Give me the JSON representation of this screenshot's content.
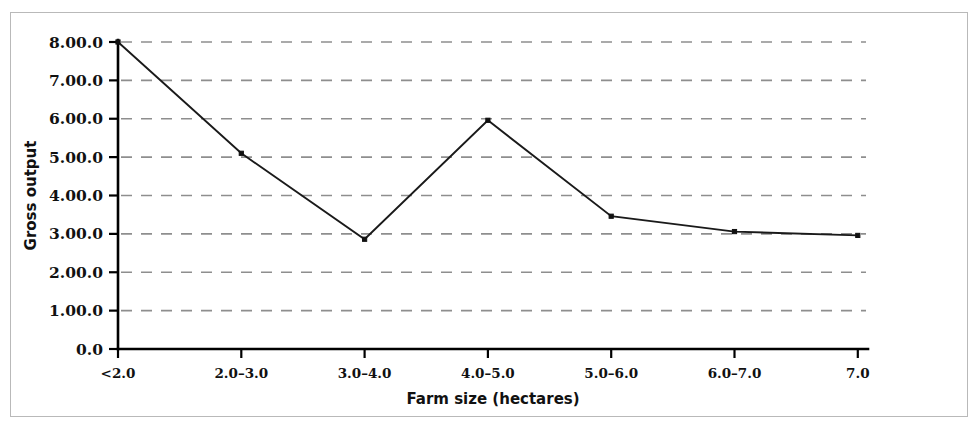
{
  "figure": {
    "background_color": "#ffffff",
    "frame_color": "#b9b9b9",
    "line_color": "#1a1a1a",
    "grid_color": "#8e8e8e",
    "axis_color": "#000000"
  },
  "axes": {
    "y_title": "Gross output",
    "x_title": "Farm size (hectares)"
  },
  "chart_data": {
    "type": "line",
    "title": "",
    "subtitle": "",
    "xlabel": "Farm size (hectares)",
    "ylabel": "Gross output",
    "categories": [
      "<2.0",
      "2.0–3.0",
      "3.0–4.0",
      "4.0–5.0",
      "5.0–6.0",
      "6.0–7.0",
      "7.0"
    ],
    "values": [
      8000.0,
      5100.0,
      2860.0,
      5960.0,
      3460.0,
      3060.0,
      2960.0
    ],
    "y_tick_values": [
      0,
      1000,
      2000,
      3000,
      4000,
      5000,
      6000,
      7000,
      8000
    ],
    "y_tick_labels": [
      "0.0",
      "1.00.0",
      "2.00.0",
      "3.00.0",
      "4.00.0",
      "5.00.0",
      "6.00.0",
      "7.00.0",
      "8.00.0"
    ],
    "x_tick_labels": [
      "<2.0",
      "2.0–3.0",
      "3.0–4.0",
      "4.0–5.0",
      "5.0–6.0",
      "6.0–7.0",
      "7.0"
    ],
    "ylim": [
      0,
      8000
    ],
    "grid": "horizontal-dashed",
    "legend": "none",
    "markers": "small filled squares",
    "series": [
      {
        "name": "Gross output",
        "values": [
          8000.0,
          5100.0,
          2860.0,
          5960.0,
          3460.0,
          3060.0,
          2960.0
        ]
      }
    ],
    "points": [
      {
        "x_label": "<2.0",
        "y": 8000.0,
        "y_display": "8.00.0"
      },
      {
        "x_label": "2.0–3.0",
        "y": 5100.0,
        "y_display": "5.10.0"
      },
      {
        "x_label": "3.0–4.0",
        "y": 2860.0,
        "y_display": "2.86.0"
      },
      {
        "x_label": "4.0–5.0",
        "y": 5960.0,
        "y_display": "5.96.0"
      },
      {
        "x_label": "5.0–6.0",
        "y": 3460.0,
        "y_display": "3.46.0"
      },
      {
        "x_label": "6.0–7.0",
        "y": 3060.0,
        "y_display": "3.06.0"
      },
      {
        "x_label": "7.0",
        "y": 2960.0,
        "y_display": "2.96.0"
      }
    ]
  }
}
